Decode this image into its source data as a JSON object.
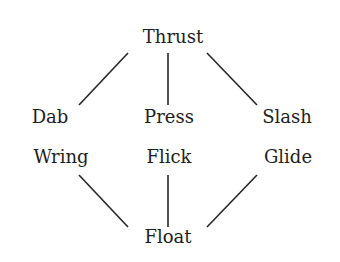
{
  "diagram": {
    "type": "effort-diamond",
    "nodes": {
      "top": "Thrust",
      "left_upper": "Dab",
      "center_upper": "Press",
      "right_upper": "Slash",
      "left_lower": "Wring",
      "center_lower": "Flick",
      "right_lower": "Glide",
      "bottom": "Float"
    },
    "edges": [
      [
        "Thrust",
        "Dab"
      ],
      [
        "Thrust",
        "Press"
      ],
      [
        "Thrust",
        "Slash"
      ],
      [
        "Wring",
        "Float"
      ],
      [
        "Flick",
        "Float"
      ],
      [
        "Glide",
        "Float"
      ]
    ]
  }
}
